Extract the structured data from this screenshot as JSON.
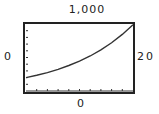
{
  "chart_data": {
    "type": "line",
    "title": "",
    "xlabel": "",
    "ylabel": "",
    "window_labels": {
      "ymax": "1,000",
      "ymin": "0",
      "xmax": "20",
      "xmin": "0"
    },
    "xlim": [
      0,
      20
    ],
    "ylim": [
      0,
      1000
    ],
    "x_tick_step": 2,
    "y_tick_step": 100,
    "grid": false,
    "legend": null,
    "series": [
      {
        "name": "curve",
        "x": [
          0,
          2,
          4,
          6,
          8,
          10,
          12,
          14,
          16,
          18,
          20
        ],
        "values": [
          200,
          235,
          275,
          323,
          380,
          445,
          522,
          613,
          720,
          845,
          990
        ]
      }
    ]
  },
  "colors": {
    "line": "#333333",
    "frame": "#222222",
    "background": "#ffffff"
  }
}
